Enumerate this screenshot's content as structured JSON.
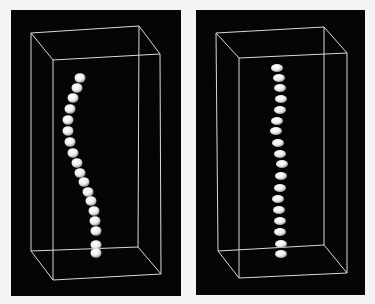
{
  "figure": {
    "background": "#f4f4f2",
    "panel_color": "#050505",
    "box_line_color": "#d9d9d9",
    "bead_color": "#eeeeee",
    "panels": [
      {
        "id": "left",
        "description": "3D bead chain (curved) inside bounding box",
        "rect": {
          "x": 11,
          "y": 10,
          "w": 170,
          "h": 286
        },
        "box": {
          "back_top": [
            [
              31,
              33
            ],
            [
              139,
              26
            ]
          ],
          "front_top": [
            [
              53,
              60
            ],
            [
              160,
              54
            ]
          ],
          "back_bottom": [
            [
              31,
              251
            ],
            [
              138,
              247
            ]
          ],
          "front_bottom": [
            [
              53,
              280
            ],
            [
              161,
              274
            ]
          ]
        },
        "beads": [
          [
            80,
            78
          ],
          [
            77,
            88
          ],
          [
            73,
            98
          ],
          [
            70,
            109
          ],
          [
            68,
            120
          ],
          [
            68,
            131
          ],
          [
            70,
            142
          ],
          [
            73,
            153
          ],
          [
            77,
            163
          ],
          [
            80,
            173
          ],
          [
            84,
            182
          ],
          [
            88,
            192
          ],
          [
            91,
            201
          ],
          [
            94,
            211
          ],
          [
            95,
            221
          ],
          [
            96,
            231
          ],
          [
            96,
            245
          ],
          [
            96,
            253
          ]
        ],
        "bead_rx": 5.5,
        "bead_ry": 4.8
      },
      {
        "id": "right",
        "description": "3D bead chain (straight) inside bounding box",
        "rect": {
          "x": 196,
          "y": 10,
          "w": 169,
          "h": 285
        },
        "box": {
          "back_top": [
            [
              216,
              33
            ],
            [
              324,
              27
            ]
          ],
          "front_top": [
            [
              239,
              58
            ],
            [
              347,
              53
            ]
          ],
          "back_bottom": [
            [
              218,
              251
            ],
            [
              324,
              245
            ]
          ],
          "front_bottom": [
            [
              239,
              278
            ],
            [
              347,
              273
            ]
          ]
        },
        "beads": [
          [
            277,
            68
          ],
          [
            279,
            78
          ],
          [
            280,
            88
          ],
          [
            281,
            99
          ],
          [
            280,
            110
          ],
          [
            277,
            121
          ],
          [
            276,
            131
          ],
          [
            278,
            143
          ],
          [
            280,
            154
          ],
          [
            282,
            164
          ],
          [
            281,
            176
          ],
          [
            280,
            188
          ],
          [
            278,
            199
          ],
          [
            279,
            210
          ],
          [
            280,
            221
          ],
          [
            280,
            232
          ],
          [
            281,
            244
          ],
          [
            281,
            254
          ]
        ],
        "bead_rx": 6,
        "bead_ry": 4
      }
    ]
  }
}
